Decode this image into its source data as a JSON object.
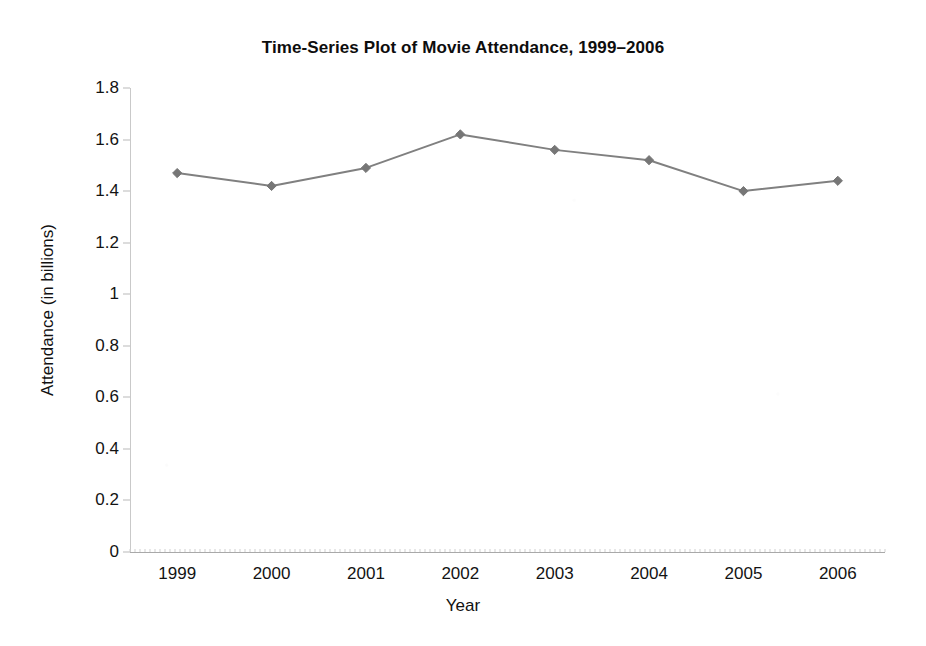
{
  "chart_data": {
    "type": "line",
    "title": "Time-Series Plot of Movie Attendance, 1999–2006",
    "xlabel": "Year",
    "ylabel": "Attendance (in billions)",
    "categories": [
      "1999",
      "2000",
      "2001",
      "2002",
      "2003",
      "2004",
      "2005",
      "2006"
    ],
    "x": [
      1999,
      2000,
      2001,
      2002,
      2003,
      2004,
      2005,
      2006
    ],
    "values": [
      1.47,
      1.42,
      1.49,
      1.62,
      1.56,
      1.52,
      1.4,
      1.44
    ],
    "series": [
      {
        "name": "Movie Attendance",
        "values": [
          1.47,
          1.42,
          1.49,
          1.62,
          1.56,
          1.52,
          1.4,
          1.44
        ]
      }
    ],
    "ylim": [
      0,
      1.8
    ],
    "yticks": [
      0,
      0.2,
      0.4,
      0.6,
      0.8,
      1,
      1.2,
      1.4,
      1.6,
      1.8
    ],
    "ytick_labels": [
      "0",
      "0.2",
      "0.4",
      "0.6",
      "0.8",
      "1",
      "1.2",
      "1.4",
      "1.6",
      "1.8"
    ],
    "xticks": [
      1999,
      2000,
      2001,
      2002,
      2003,
      2004,
      2005,
      2006
    ],
    "xtick_labels": [
      "1999",
      "2000",
      "2001",
      "2002",
      "2003",
      "2004",
      "2005",
      "2006"
    ],
    "grid": false,
    "legend": false,
    "legend_position": "none",
    "marker": "diamond",
    "line_color": "#808080",
    "marker_color": "#767676",
    "axis_color": "#b0b0b0",
    "background_color": "#ffffff",
    "text_color": "#111111"
  }
}
